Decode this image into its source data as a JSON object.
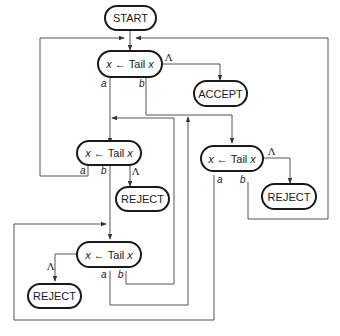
{
  "diagram": {
    "type": "flowchart",
    "nodes": {
      "start": {
        "label": "START"
      },
      "accept": {
        "label": "ACCEPT"
      },
      "reject1": {
        "label": "REJECT"
      },
      "reject2": {
        "label": "REJECT"
      },
      "reject3": {
        "label": "REJECT"
      },
      "step1": {
        "var": "x",
        "arrow": "←",
        "op": "Tail",
        "arg": "x"
      },
      "step2": {
        "var": "x",
        "arrow": "←",
        "op": "Tail",
        "arg": "x"
      },
      "step3": {
        "var": "x",
        "arrow": "←",
        "op": "Tail",
        "arg": "x"
      },
      "step4": {
        "var": "x",
        "arrow": "←",
        "op": "Tail",
        "arg": "x"
      }
    },
    "edge_labels": {
      "a": "a",
      "b": "b",
      "lambda": "Λ"
    },
    "edges": [
      {
        "from": "start",
        "to": "step1"
      },
      {
        "from": "step1",
        "to": "accept",
        "label": "Λ"
      },
      {
        "from": "step1",
        "to": "step2",
        "label": "a"
      },
      {
        "from": "step1",
        "to": "step3",
        "label": "b"
      },
      {
        "from": "step2",
        "to": "step1",
        "label": "a"
      },
      {
        "from": "step2",
        "to": "step4",
        "label": "b"
      },
      {
        "from": "step2",
        "to": "reject1",
        "label": "Λ"
      },
      {
        "from": "step3",
        "to": "step4",
        "label": "a"
      },
      {
        "from": "step3",
        "to": "step1",
        "label": "b"
      },
      {
        "from": "step3",
        "to": "reject2",
        "label": "Λ"
      },
      {
        "from": "step4",
        "to": "step3",
        "label": "a"
      },
      {
        "from": "step4",
        "to": "step2",
        "label": "b"
      },
      {
        "from": "step4",
        "to": "reject3",
        "label": "Λ"
      }
    ],
    "colors": {
      "line": "#555555",
      "border": "#1a1a1a",
      "background": "#ffffff"
    }
  }
}
